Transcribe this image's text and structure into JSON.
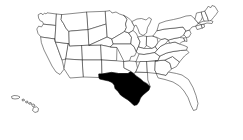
{
  "figure": {
    "kind": "choropleth-outline-map",
    "region_name": "United States of America",
    "width_px": 243,
    "height_px": 140,
    "background_color": "#ffffff",
    "outline_color": "#2b2b2b",
    "highlight_color": "#000000",
    "default_fill_color": "#ffffff",
    "title": "",
    "caption": "",
    "legend": [],
    "labels": []
  },
  "selection": {
    "highlighted_state_name": "Texas",
    "highlighted_state_code": "TX",
    "highlighted_count": 1,
    "highlighted_fill": "#000000"
  },
  "insets": [
    {
      "name": "Alaska",
      "code": "AK",
      "label": ""
    },
    {
      "name": "Hawaii",
      "code": "HI",
      "label": ""
    }
  ],
  "states": [
    {
      "code": "WA",
      "name": "Washington",
      "highlighted": false
    },
    {
      "code": "OR",
      "name": "Oregon",
      "highlighted": false
    },
    {
      "code": "CA",
      "name": "California",
      "highlighted": false
    },
    {
      "code": "NV",
      "name": "Nevada",
      "highlighted": false
    },
    {
      "code": "ID",
      "name": "Idaho",
      "highlighted": false
    },
    {
      "code": "MT",
      "name": "Montana",
      "highlighted": false
    },
    {
      "code": "WY",
      "name": "Wyoming",
      "highlighted": false
    },
    {
      "code": "UT",
      "name": "Utah",
      "highlighted": false
    },
    {
      "code": "AZ",
      "name": "Arizona",
      "highlighted": false
    },
    {
      "code": "CO",
      "name": "Colorado",
      "highlighted": false
    },
    {
      "code": "NM",
      "name": "New Mexico",
      "highlighted": false
    },
    {
      "code": "ND",
      "name": "North Dakota",
      "highlighted": false
    },
    {
      "code": "SD",
      "name": "South Dakota",
      "highlighted": false
    },
    {
      "code": "NE",
      "name": "Nebraska",
      "highlighted": false
    },
    {
      "code": "KS",
      "name": "Kansas",
      "highlighted": false
    },
    {
      "code": "OK",
      "name": "Oklahoma",
      "highlighted": false
    },
    {
      "code": "TX",
      "name": "Texas",
      "highlighted": true
    },
    {
      "code": "MN",
      "name": "Minnesota",
      "highlighted": false
    },
    {
      "code": "IA",
      "name": "Iowa",
      "highlighted": false
    },
    {
      "code": "MO",
      "name": "Missouri",
      "highlighted": false
    },
    {
      "code": "AR",
      "name": "Arkansas",
      "highlighted": false
    },
    {
      "code": "LA",
      "name": "Louisiana",
      "highlighted": false
    },
    {
      "code": "WI",
      "name": "Wisconsin",
      "highlighted": false
    },
    {
      "code": "IL",
      "name": "Illinois",
      "highlighted": false
    },
    {
      "code": "MI",
      "name": "Michigan",
      "highlighted": false
    },
    {
      "code": "IN",
      "name": "Indiana",
      "highlighted": false
    },
    {
      "code": "OH",
      "name": "Ohio",
      "highlighted": false
    },
    {
      "code": "KY",
      "name": "Kentucky",
      "highlighted": false
    },
    {
      "code": "TN",
      "name": "Tennessee",
      "highlighted": false
    },
    {
      "code": "MS",
      "name": "Mississippi",
      "highlighted": false
    },
    {
      "code": "AL",
      "name": "Alabama",
      "highlighted": false
    },
    {
      "code": "GA",
      "name": "Georgia",
      "highlighted": false
    },
    {
      "code": "FL",
      "name": "Florida",
      "highlighted": false
    },
    {
      "code": "SC",
      "name": "South Carolina",
      "highlighted": false
    },
    {
      "code": "NC",
      "name": "North Carolina",
      "highlighted": false
    },
    {
      "code": "VA",
      "name": "Virginia",
      "highlighted": false
    },
    {
      "code": "WV",
      "name": "West Virginia",
      "highlighted": false
    },
    {
      "code": "MD",
      "name": "Maryland",
      "highlighted": false
    },
    {
      "code": "DE",
      "name": "Delaware",
      "highlighted": false
    },
    {
      "code": "PA",
      "name": "Pennsylvania",
      "highlighted": false
    },
    {
      "code": "NJ",
      "name": "New Jersey",
      "highlighted": false
    },
    {
      "code": "NY",
      "name": "New York",
      "highlighted": false
    },
    {
      "code": "CT",
      "name": "Connecticut",
      "highlighted": false
    },
    {
      "code": "RI",
      "name": "Rhode Island",
      "highlighted": false
    },
    {
      "code": "MA",
      "name": "Massachusetts",
      "highlighted": false
    },
    {
      "code": "VT",
      "name": "Vermont",
      "highlighted": false
    },
    {
      "code": "NH",
      "name": "New Hampshire",
      "highlighted": false
    },
    {
      "code": "ME",
      "name": "Maine",
      "highlighted": false
    }
  ]
}
